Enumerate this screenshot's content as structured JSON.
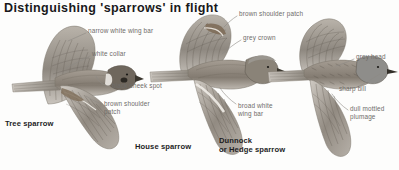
{
  "title": "Distinguishing 'sparrows' in flight",
  "palette": {
    "background": "#fdfdfc",
    "title_color": "#18181a",
    "label_color": "#6e6c69",
    "caption_color": "#1d1d1f",
    "plumage_dark": "#6b6258",
    "plumage_mid": "#9b948a",
    "plumage_light": "#c8c3bb",
    "leader_line": "#8d8a85"
  },
  "annotations": [
    {
      "id": "narrow-white-wing-bar",
      "text": "narrow white wing bar",
      "x": 88,
      "y": 31
    },
    {
      "id": "white-collar",
      "text": "white collar",
      "x": 92,
      "y": 54
    },
    {
      "id": "black-cheek-spot",
      "text": "black cheek spot",
      "x": 112,
      "y": 86
    },
    {
      "id": "brown-shoulder-patch-tree",
      "text": "brown shoulder\npatch",
      "x": 104,
      "y": 104
    },
    {
      "id": "brown-shoulder-patch-house",
      "text": "brown shoulder patch",
      "x": 239,
      "y": 14
    },
    {
      "id": "grey-crown",
      "text": "grey crown",
      "x": 243,
      "y": 38
    },
    {
      "id": "broad-white-wing-bar",
      "text": "broad white\nwing bar",
      "x": 238,
      "y": 106
    },
    {
      "id": "grey-head",
      "text": "grey head",
      "x": 356,
      "y": 57
    },
    {
      "id": "sharp-bill",
      "text": "sharp bill",
      "x": 339,
      "y": 89
    },
    {
      "id": "dull-mottled-plumage",
      "text": "dull mottled\nplumage",
      "x": 350,
      "y": 109
    }
  ],
  "captions": [
    {
      "id": "tree-sparrow",
      "text": "Tree sparrow",
      "x": 5,
      "y": 119
    },
    {
      "id": "house-sparrow",
      "text": "House sparrow",
      "x": 135,
      "y": 146
    },
    {
      "id": "dunnock",
      "text": "Dunnock\nor Hedge sparrow",
      "x": 219,
      "y": 139
    }
  ],
  "birds": [
    {
      "id": "tree-sparrow-illustration",
      "species": "Tree sparrow"
    },
    {
      "id": "house-sparrow-illustration",
      "species": "House sparrow"
    },
    {
      "id": "dunnock-illustration",
      "species": "Dunnock or Hedge sparrow"
    }
  ]
}
